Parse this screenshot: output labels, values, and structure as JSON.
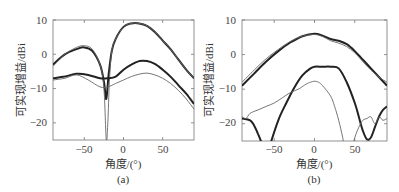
{
  "chart_data": [
    {
      "panel": "(a)",
      "type": "line",
      "xlabel": "角度/(°)",
      "ylabel": "可实现增益/dBi",
      "xlim": [
        -90,
        90
      ],
      "ylim": [
        -25,
        10
      ],
      "xticks": [
        -50,
        0,
        50
      ],
      "yticks": [
        10,
        0,
        -10,
        -20
      ],
      "grid": false,
      "series": [
        {
          "name": "thick-main-lobe",
          "style": "thick",
          "x": [
            -90,
            -75,
            -60,
            -50,
            -40,
            -30,
            -25,
            -22,
            -19,
            -15,
            -10,
            0,
            10,
            20,
            30,
            40,
            50,
            60,
            70,
            80,
            90
          ],
          "y": [
            -3,
            0,
            1.5,
            2,
            1,
            -3,
            -8,
            -13,
            -6,
            1,
            4.5,
            8,
            9,
            9,
            8.3,
            6.5,
            4,
            1.5,
            -1.5,
            -4.5,
            -7
          ]
        },
        {
          "name": "thin-main-lobe",
          "style": "thin",
          "x": [
            -90,
            -75,
            -60,
            -50,
            -40,
            -30,
            -25,
            -22,
            -20,
            -18,
            -15,
            -10,
            0,
            10,
            20,
            30,
            40,
            50,
            60,
            70,
            80,
            90
          ],
          "y": [
            -3.5,
            0,
            2,
            2.5,
            1.5,
            -3,
            -10,
            -25,
            -20,
            -8,
            1,
            4.5,
            8,
            9,
            9,
            8.3,
            6.5,
            4,
            1.5,
            -1.5,
            -4.5,
            -7
          ]
        },
        {
          "name": "thick-low",
          "style": "thick",
          "x": [
            -90,
            -75,
            -60,
            -45,
            -30,
            -20,
            -10,
            0,
            10,
            20,
            30,
            40,
            50,
            60,
            70,
            80,
            90
          ],
          "y": [
            -7,
            -6.5,
            -5.7,
            -6,
            -7,
            -7,
            -6.5,
            -4.5,
            -3,
            -2,
            -2,
            -2.8,
            -4.5,
            -6.5,
            -9,
            -11.5,
            -14.5
          ]
        },
        {
          "name": "thin-low",
          "style": "thin",
          "x": [
            -90,
            -75,
            -60,
            -45,
            -30,
            -20,
            -10,
            0,
            10,
            20,
            30,
            40,
            50,
            60,
            70,
            80,
            90
          ],
          "y": [
            -7.5,
            -7,
            -6,
            -7.5,
            -9.5,
            -9.5,
            -8.5,
            -7.5,
            -6.5,
            -5.8,
            -5.5,
            -6,
            -7,
            -8.5,
            -10.5,
            -13,
            -16
          ]
        }
      ],
      "caption": "(a)"
    },
    {
      "panel": "(b)",
      "type": "line",
      "xlabel": "角度/(°)",
      "ylabel": "可实现增益/dBi",
      "xlim": [
        -90,
        90
      ],
      "ylim": [
        -25,
        10
      ],
      "xticks": [
        -50,
        0,
        50
      ],
      "yticks": [
        10,
        0,
        -10,
        -20
      ],
      "grid": false,
      "series": [
        {
          "name": "thick-main",
          "style": "thick",
          "x": [
            -90,
            -75,
            -60,
            -45,
            -30,
            -15,
            0,
            10,
            20,
            30,
            40,
            50,
            60,
            70,
            80,
            90
          ],
          "y": [
            -9,
            -5.5,
            -2,
            1,
            3.5,
            5.3,
            6,
            5.5,
            4.5,
            4,
            3,
            1,
            -1.5,
            -4,
            -6.5,
            -9
          ]
        },
        {
          "name": "thin-main",
          "style": "thin",
          "x": [
            -90,
            -75,
            -60,
            -45,
            -30,
            -15,
            0,
            10,
            20,
            30,
            40,
            50,
            60,
            70,
            80,
            90
          ],
          "y": [
            -8,
            -4.5,
            -1.2,
            1.5,
            3.8,
            5.3,
            5.8,
            5.2,
            4,
            3.3,
            2.3,
            0.5,
            -2,
            -4.5,
            -6.5,
            -8
          ]
        },
        {
          "name": "thick-inner",
          "style": "thick",
          "x": [
            -90,
            -80,
            -75,
            -70,
            -65,
            -60,
            -55,
            -45,
            -35,
            -25,
            -15,
            -5,
            0,
            10,
            20,
            30,
            40,
            50,
            55,
            60,
            65,
            70,
            75,
            80,
            85,
            90
          ],
          "y": [
            -18.5,
            -19,
            -20.5,
            -23,
            -26,
            -30,
            -26,
            -19,
            -14,
            -9.5,
            -6,
            -4,
            -3.5,
            -3.5,
            -3.5,
            -4,
            -8,
            -14,
            -18,
            -22,
            -24.5,
            -24,
            -21,
            -18,
            -16,
            -15
          ]
        },
        {
          "name": "thin-inner",
          "style": "thin",
          "x": [
            -90,
            -85,
            -80,
            -70,
            -60,
            -50,
            -40,
            -30,
            -20,
            -10,
            -5,
            0,
            5,
            10,
            20,
            25,
            30,
            35,
            38,
            45,
            50,
            55,
            60,
            65,
            70,
            75,
            80,
            85,
            90
          ],
          "y": [
            -18,
            -18.5,
            -17,
            -16,
            -15,
            -14,
            -12.5,
            -11,
            -10,
            -8.5,
            -8,
            -7.7,
            -8,
            -9,
            -12,
            -15,
            -19,
            -24,
            -28,
            -28,
            -24,
            -21,
            -19,
            -18.5,
            -18,
            -20,
            -18,
            -19,
            -18.5
          ]
        }
      ],
      "caption": "(b)"
    }
  ],
  "labels": {
    "a": {
      "ylabel": "可实现增益/dBi",
      "xlabel": "角度/(°)",
      "caption": "(a)",
      "yticks": [
        "10",
        "0",
        "−10",
        "−20"
      ],
      "xticks": [
        "−50",
        "0",
        "50"
      ]
    },
    "b": {
      "ylabel": "可实现增益/dBi",
      "xlabel": "角度/(°)",
      "caption": "(b)",
      "yticks": [
        "10",
        "0",
        "−10",
        "−20"
      ],
      "xticks": [
        "−50",
        "0",
        "50"
      ]
    }
  }
}
